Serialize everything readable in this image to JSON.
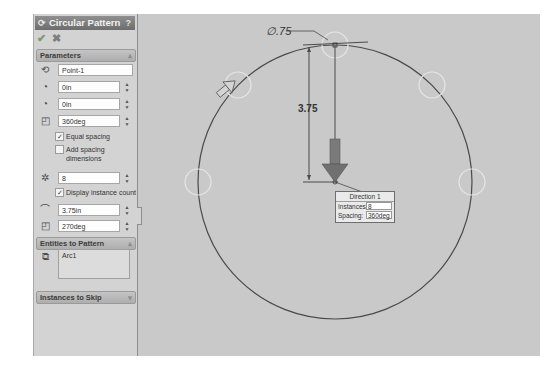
{
  "panel": {
    "title": "Circular Pattern",
    "title_icon": "circular-pattern-icon",
    "help_label": "?",
    "ok_glyph": "✔",
    "cancel_glyph": "✖",
    "parameters": {
      "header": "Parameters",
      "collapse_glyph": "⩓",
      "center_value": "Point-1",
      "center_x_value": "0in",
      "center_y_value": "0in",
      "angle_value": "360deg",
      "equal_spacing_label": "Equal spacing",
      "equal_spacing_checked": true,
      "add_spacing_dims_label": "Add spacing dimensions",
      "add_spacing_dims_checked": false,
      "instances_value": "8",
      "display_instance_count_label": "Display instance count",
      "display_instance_count_checked": true,
      "radius_value": "3.75in",
      "arc_angle_value": "270deg",
      "check_glyph": "✓"
    },
    "entities": {
      "header": "Entities to Pattern",
      "collapse_glyph": "⩓",
      "items": [
        "Arc1"
      ]
    },
    "skip": {
      "header": "Instances to Skip",
      "expand_glyph": "⩔"
    }
  },
  "graphics": {
    "diameter_dim": "∅.75",
    "radius_dim": "3.75",
    "callout": {
      "title": "Direction 1",
      "instances_label": "Instances:",
      "instances_value": "8",
      "spacing_label": "Spacing:",
      "spacing_value": "360deg"
    },
    "colors": {
      "background": "#c9c9c9",
      "geometry": "#4a4a4a",
      "arrow": "#6a6a6a",
      "ghost_instance": "#e6e6e6"
    }
  }
}
